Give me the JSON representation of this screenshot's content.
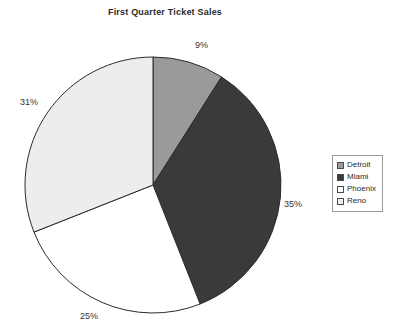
{
  "chart_data": {
    "type": "pie",
    "title": "First Quarter Ticket Sales",
    "categories": [
      "Detroit",
      "Miami",
      "Phoenix",
      "Reno"
    ],
    "values": [
      9,
      35,
      25,
      31
    ],
    "value_labels": [
      "9%",
      "35%",
      "25%",
      "31%"
    ],
    "units": "percent",
    "start_angle_deg": 0,
    "direction": "clockwise",
    "grid": false,
    "xlabel": "",
    "ylabel": "",
    "legend": {
      "position": "right",
      "entries": [
        {
          "label": "Detroit",
          "color": "#9a9a9a"
        },
        {
          "label": "Miami",
          "color": "#3a3a3a"
        },
        {
          "label": "Phoenix",
          "color": "#ffffff"
        },
        {
          "label": "Reno",
          "color": "#ededed"
        }
      ]
    },
    "slices": [
      {
        "name": "Detroit",
        "value": 9,
        "label": "9%",
        "color": "#9a9a9a"
      },
      {
        "name": "Miami",
        "value": 35,
        "label": "35%",
        "color": "#3a3a3a"
      },
      {
        "name": "Phoenix",
        "value": 25,
        "label": "25%",
        "color": "#ffffff"
      },
      {
        "name": "Reno",
        "value": 31,
        "label": "31%",
        "color": "#ededed"
      }
    ],
    "colors": {
      "slice_outline": "#2b2b2b",
      "text": "#2b2b2b",
      "background": "#ffffff",
      "legend_border": "#9b9b9b"
    }
  }
}
